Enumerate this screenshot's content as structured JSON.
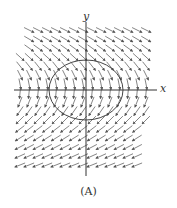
{
  "figure": {
    "x_label": "x",
    "y_label": "y",
    "caption": "(A)",
    "colors": {
      "arrows": "#555555",
      "axes": "#333333",
      "ellipse": "#444444"
    }
  }
}
